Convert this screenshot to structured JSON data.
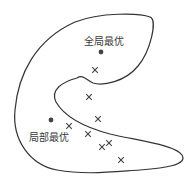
{
  "diagram": {
    "type": "optimization-landscape",
    "colors": {
      "stroke": "#333333",
      "text": "#3a3a3a",
      "marker": "#444444",
      "background": "#ffffff"
    },
    "labels": {
      "global_optimum": "全局最优",
      "local_optimum": "局部最优"
    },
    "optima": [
      {
        "name": "global",
        "x": 101,
        "y": 52
      },
      {
        "name": "local",
        "x": 51,
        "y": 120
      }
    ],
    "samples": [
      {
        "x": 95,
        "y": 70
      },
      {
        "x": 89,
        "y": 97
      },
      {
        "x": 98,
        "y": 119
      },
      {
        "x": 69,
        "y": 126
      },
      {
        "x": 88,
        "y": 134
      },
      {
        "x": 102,
        "y": 147
      },
      {
        "x": 109,
        "y": 143
      },
      {
        "x": 121,
        "y": 160
      }
    ]
  }
}
